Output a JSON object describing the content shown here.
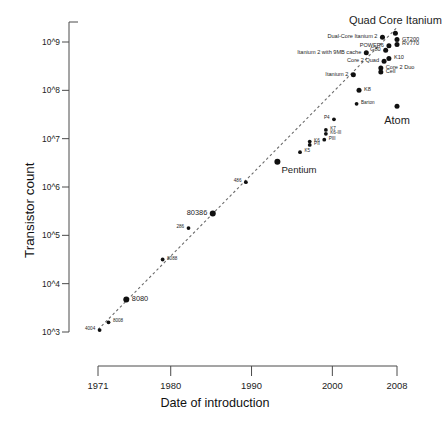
{
  "chart_data": {
    "type": "scatter",
    "title": "",
    "xlabel": "Date of introduction",
    "ylabel": "Transistor count",
    "xlim": [
      1971,
      2008
    ],
    "ylim_log10": [
      3,
      9.35
    ],
    "xticks": [
      "1971",
      "1980",
      "1990",
      "2000",
      "2008"
    ],
    "xtick_values": [
      1971,
      1980,
      1990,
      2000,
      2008
    ],
    "yticks": [
      "10^3",
      "10^4",
      "10^5",
      "10^6",
      "10^7",
      "10^8",
      "10^9"
    ],
    "ytick_log10": [
      3,
      4,
      5,
      6,
      7,
      8,
      9
    ],
    "grid": false,
    "legend": null,
    "trendline": {
      "style": "dashed",
      "color": "#6b6b6b",
      "x_start": 1971.0,
      "y_start_log10": 3.05,
      "x_end": 2008.0,
      "y_end_log10": 9.3
    },
    "point_color": "#101010",
    "points": [
      {
        "name": "4004",
        "year": 1971.2,
        "count_log10": 3.04,
        "size": "xs",
        "label_pos": "left"
      },
      {
        "name": "8008",
        "year": 1972.3,
        "count_log10": 3.2,
        "size": "xs",
        "label_pos": "right"
      },
      {
        "name": "8080",
        "year": 1974.5,
        "count_log10": 3.67,
        "size": "m",
        "label_pos": "right"
      },
      {
        "name": "8088",
        "year": 1979.0,
        "count_log10": 4.5,
        "size": "xs",
        "label_pos": "right"
      },
      {
        "name": "286",
        "year": 1982.2,
        "count_log10": 5.15,
        "size": "xs",
        "label_pos": "left"
      },
      {
        "name": "80386",
        "year": 1985.2,
        "count_log10": 5.45,
        "size": "m",
        "label_pos": "left"
      },
      {
        "name": "486",
        "year": 1989.3,
        "count_log10": 6.1,
        "size": "xs",
        "label_pos": "left"
      },
      {
        "name": "Pentium",
        "year": 1993.2,
        "count_log10": 6.52,
        "size": "m",
        "label_pos": "right-below"
      },
      {
        "name": "K5",
        "year": 1996.0,
        "count_log10": 6.72,
        "size": "xs",
        "label_pos": "right"
      },
      {
        "name": "K6",
        "year": 1997.2,
        "count_log10": 6.94,
        "size": "xs",
        "label_pos": "right"
      },
      {
        "name": "PII",
        "year": 1997.2,
        "count_log10": 6.87,
        "size": "xs",
        "label_pos": "right"
      },
      {
        "name": "PIII",
        "year": 1999.0,
        "count_log10": 6.98,
        "size": "xs",
        "label_pos": "right"
      },
      {
        "name": "K7",
        "year": 1999.2,
        "count_log10": 7.18,
        "size": "xs",
        "label_pos": "right"
      },
      {
        "name": "K6-III",
        "year": 1999.2,
        "count_log10": 7.1,
        "size": "xs",
        "label_pos": "right"
      },
      {
        "name": "P4",
        "year": 2000.2,
        "count_log10": 7.4,
        "size": "xs",
        "label_pos": "left"
      },
      {
        "name": "Barton",
        "year": 2003.0,
        "count_log10": 7.72,
        "size": "xs",
        "label_pos": "right"
      },
      {
        "name": "K8",
        "year": 2003.3,
        "count_log10": 8.0,
        "size": "s",
        "label_pos": "right"
      },
      {
        "name": "Atom",
        "year": 2008.0,
        "count_log10": 7.67,
        "size": "s",
        "label_pos": "below-large"
      },
      {
        "name": "Itanium 2",
        "year": 2002.6,
        "count_log10": 8.32,
        "size": "s",
        "label_pos": "left"
      },
      {
        "name": "Cell",
        "year": 2006.0,
        "count_log10": 8.38,
        "size": "s",
        "label_pos": "right"
      },
      {
        "name": "Core 2 Duo",
        "year": 2006.0,
        "count_log10": 8.46,
        "size": "s",
        "label_pos": "right"
      },
      {
        "name": "Core 2 Quad",
        "year": 2006.4,
        "count_log10": 8.6,
        "size": "s",
        "label_pos": "left"
      },
      {
        "name": "K10",
        "year": 2007.0,
        "count_log10": 8.66,
        "size": "s",
        "label_pos": "right"
      },
      {
        "name": "Itanium 2 with 9MB cache",
        "year": 2004.2,
        "count_log10": 8.78,
        "size": "s",
        "label_pos": "left"
      },
      {
        "name": "G80",
        "year": 2006.6,
        "count_log10": 8.83,
        "size": "s",
        "label_pos": "left"
      },
      {
        "name": "POWER6",
        "year": 2007.0,
        "count_log10": 8.92,
        "size": "s",
        "label_pos": "left"
      },
      {
        "name": "RV770",
        "year": 2008.0,
        "count_log10": 8.95,
        "size": "s",
        "label_pos": "right"
      },
      {
        "name": "GT200",
        "year": 2008.0,
        "count_log10": 9.05,
        "size": "s",
        "label_pos": "right"
      },
      {
        "name": "Dual-Core Itanium 2",
        "year": 2006.2,
        "count_log10": 9.1,
        "size": "s",
        "label_pos": "left"
      },
      {
        "name": "Quad Core Itanium",
        "year": 2007.8,
        "count_log10": 9.18,
        "size": "s",
        "label_pos": "above-large"
      }
    ]
  }
}
